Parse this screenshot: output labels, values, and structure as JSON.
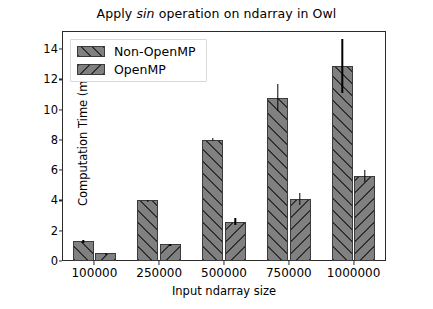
{
  "chart_data": {
    "type": "bar",
    "title": "Apply sin operation on ndarray in Owl",
    "title_parts": {
      "before": "Apply ",
      "italic": "sin",
      "after": " operation on ndarray in Owl"
    },
    "xlabel": "Input ndarray size",
    "ylabel": "Computation Time (ms)",
    "categories": [
      "100000",
      "250000",
      "500000",
      "750000",
      "1000000"
    ],
    "ylim": [
      0,
      15.2
    ],
    "yticks": [
      0,
      2,
      4,
      6,
      8,
      10,
      12,
      14
    ],
    "grid": false,
    "legend_position": "upper left",
    "series": [
      {
        "name": "Non-OpenMP",
        "hatch": "/",
        "color": "#808080",
        "values": [
          1.3,
          4.0,
          8.0,
          10.8,
          12.9
        ],
        "errors": [
          0.1,
          0.05,
          0.1,
          0.9,
          1.8
        ]
      },
      {
        "name": "OpenMP",
        "hatch": "\\",
        "color": "#808080",
        "values": [
          0.5,
          1.1,
          2.6,
          4.1,
          5.6
        ],
        "errors": [
          0.05,
          0.05,
          0.25,
          0.4,
          0.4
        ]
      }
    ]
  }
}
